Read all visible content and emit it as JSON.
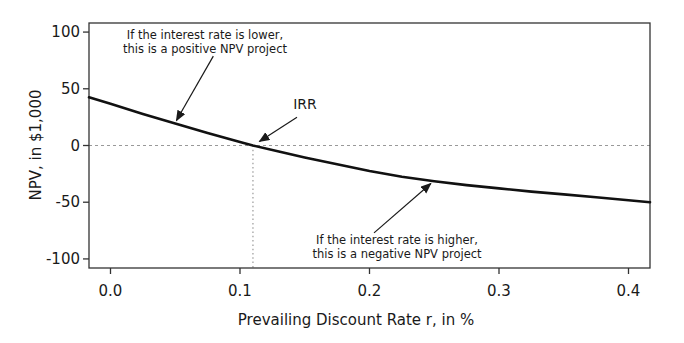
{
  "chart_data": {
    "type": "line",
    "title": "",
    "xlabel": "Prevailing Discount Rate r, in %",
    "ylabel": "NPV, in $1,000",
    "xlim": [
      -0.0166,
      0.4166
    ],
    "ylim": [
      -108,
      108
    ],
    "grid": false,
    "x_ticks": [
      0.0,
      0.1,
      0.2,
      0.3,
      0.4
    ],
    "x_tick_labels": [
      "0.0",
      "0.1",
      "0.2",
      "0.3",
      "0.4"
    ],
    "y_ticks": [
      -100,
      -50,
      0,
      50,
      100
    ],
    "y_tick_labels": [
      "-100",
      "-50",
      "0",
      "50",
      "100"
    ],
    "series": [
      {
        "name": "NPV profile",
        "x": [
          -0.0166,
          0.0,
          0.025,
          0.05,
          0.075,
          0.1,
          0.11,
          0.13,
          0.15,
          0.175,
          0.2,
          0.225,
          0.25,
          0.275,
          0.3,
          0.325,
          0.35,
          0.375,
          0.4,
          0.4166
        ],
        "y": [
          42.5,
          36.8,
          27.8,
          19.5,
          11.0,
          3.2,
          0.0,
          -5.3,
          -10.5,
          -16.6,
          -22.5,
          -27.5,
          -31.5,
          -34.9,
          -37.8,
          -40.6,
          -43.1,
          -45.7,
          -48.2,
          -50.0
        ]
      }
    ],
    "irr": 0.11,
    "reference_lines": [
      {
        "orientation": "horizontal",
        "value": 0,
        "style": "dashed",
        "extent": "full"
      },
      {
        "orientation": "vertical",
        "value": 0.11,
        "style": "dotted",
        "from_y": -108,
        "to_y": 0
      }
    ],
    "annotations": [
      {
        "id": "lower-rate",
        "text": "If the interest rate is lower,\nthis is a positive NPV project",
        "arrow_from": [
          0.0794,
          78.8
        ],
        "arrow_to": [
          0.0509,
          22.0
        ]
      },
      {
        "id": "irr",
        "text": "IRR",
        "arrow_from": [
          0.144,
          25.0
        ],
        "arrow_to": [
          0.115,
          3.5
        ]
      },
      {
        "id": "higher-rate",
        "text": "If the interest rate is higher,\nthis is a negative NPV project",
        "arrow_from": [
          0.2035,
          -77.0
        ],
        "arrow_to": [
          0.2474,
          -33.5
        ]
      }
    ],
    "colors": {
      "curve": "#111111",
      "axis": "#333333",
      "reference": "#999999",
      "arrow": "#1a1a1a",
      "text": "#1a1a1a",
      "background": "#ffffff"
    }
  }
}
